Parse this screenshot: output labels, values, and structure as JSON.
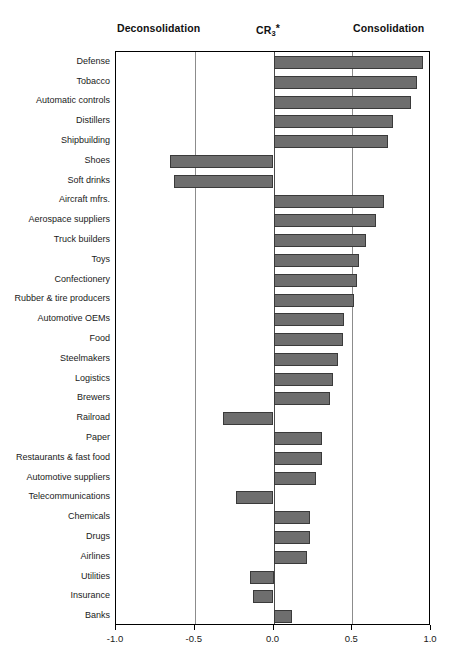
{
  "header": {
    "left_label": "Deconsolidation",
    "center_label_base": "CR",
    "center_label_sub": "3",
    "center_label_star": "*",
    "right_label": "Consolidation"
  },
  "colors": {
    "bar_fill": "#6e6e6e",
    "bar_stroke": "#3a3a3a",
    "axis": "#000000",
    "gridline": "#8c8c8c",
    "background": "#ffffff"
  },
  "chart_data": {
    "type": "bar",
    "orientation": "horizontal",
    "title": "CR3*",
    "xlabel": "",
    "ylabel": "",
    "xlim": [
      -1.0,
      1.0
    ],
    "xticks": [
      "-1.0",
      "-0.5",
      "0.0",
      "0.5",
      "1.0"
    ],
    "xtick_values": [
      -1.0,
      -0.5,
      0.0,
      0.5,
      1.0
    ],
    "grid": true,
    "legend": "none",
    "annotations": [
      "Deconsolidation",
      "CR3*",
      "Consolidation"
    ],
    "categories": [
      "Defense",
      "Tobacco",
      "Automatic controls",
      "Distillers",
      "Shipbuilding",
      "Shoes",
      "Soft drinks",
      "Aircraft mfrs.",
      "Aerospace suppliers",
      "Truck builders",
      "Toys",
      "Confectionery",
      "Rubber & tire producers",
      "Automotive OEMs",
      "Food",
      "Steelmakers",
      "Logistics",
      "Brewers",
      "Railroad",
      "Paper",
      "Restaurants & fast food",
      "Automotive suppliers",
      "Telecommunications",
      "Chemicals",
      "Drugs",
      "Airlines",
      "Utilities",
      "Insurance",
      "Banks"
    ],
    "values": [
      0.95,
      0.91,
      0.87,
      0.76,
      0.73,
      -0.66,
      -0.63,
      0.7,
      0.65,
      0.59,
      0.54,
      0.53,
      0.51,
      0.45,
      0.44,
      0.41,
      0.38,
      0.36,
      -0.32,
      0.31,
      0.31,
      0.27,
      -0.24,
      0.23,
      0.23,
      0.21,
      -0.15,
      -0.13,
      0.12
    ]
  }
}
